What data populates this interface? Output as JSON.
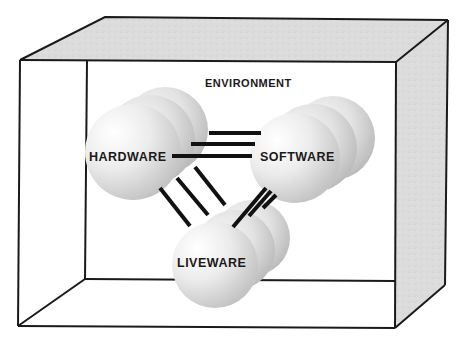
{
  "diagram": {
    "type": "SHELL model (3D box with interacting spheres)",
    "labels": {
      "environment": "ENVIRONMENT",
      "hardware": "HARDWARE",
      "software": "SOFTWARE",
      "liveware": "LIVEWARE"
    },
    "nodes": [
      {
        "id": "hardware",
        "label": "HARDWARE",
        "spheres": 3
      },
      {
        "id": "software",
        "label": "SOFTWARE",
        "spheres": 3
      },
      {
        "id": "liveware",
        "label": "LIVEWARE",
        "spheres": 3
      }
    ],
    "edges": [
      {
        "from": "hardware",
        "to": "software",
        "lines": 3
      },
      {
        "from": "hardware",
        "to": "liveware",
        "lines": 3
      },
      {
        "from": "software",
        "to": "liveware",
        "lines": 3
      }
    ],
    "container": "ENVIRONMENT",
    "colors": {
      "line": "#1a1a1a",
      "box_shade": "#d9d9d9",
      "sphere_light": "#f7f7f7",
      "sphere_dark": "#bdbdbd"
    }
  }
}
